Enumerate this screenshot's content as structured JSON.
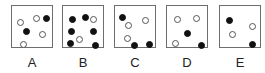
{
  "options": [
    {
      "label": "A",
      "left": 11,
      "dots": [
        {
          "x": 5,
          "y": 13,
          "type": "open"
        },
        {
          "x": 21,
          "y": 9,
          "type": "open"
        },
        {
          "x": 31,
          "y": 9,
          "type": "filled"
        },
        {
          "x": 11,
          "y": 22,
          "type": "filled"
        },
        {
          "x": 27,
          "y": 25,
          "type": "open"
        },
        {
          "x": 8,
          "y": 35,
          "type": "open"
        }
      ]
    },
    {
      "label": "B",
      "left": 62,
      "dots": [
        {
          "x": 6,
          "y": 10,
          "type": "filled"
        },
        {
          "x": 19,
          "y": 8,
          "type": "filled"
        },
        {
          "x": 27,
          "y": 10,
          "type": "open"
        },
        {
          "x": 5,
          "y": 22,
          "type": "filled"
        },
        {
          "x": 27,
          "y": 22,
          "type": "filled"
        },
        {
          "x": 13,
          "y": 30,
          "type": "open"
        },
        {
          "x": 4,
          "y": 34,
          "type": "filled"
        },
        {
          "x": 29,
          "y": 36,
          "type": "filled"
        }
      ]
    },
    {
      "label": "C",
      "left": 114,
      "dots": [
        {
          "x": 4,
          "y": 8,
          "type": "filled"
        },
        {
          "x": 10,
          "y": 16,
          "type": "open"
        },
        {
          "x": 27,
          "y": 11,
          "type": "open"
        },
        {
          "x": 9,
          "y": 29,
          "type": "open"
        },
        {
          "x": 16,
          "y": 36,
          "type": "filled"
        },
        {
          "x": 31,
          "y": 35,
          "type": "filled"
        }
      ]
    },
    {
      "label": "D",
      "left": 166,
      "dots": [
        {
          "x": 7,
          "y": 10,
          "type": "open"
        },
        {
          "x": 26,
          "y": 9,
          "type": "open"
        },
        {
          "x": 17,
          "y": 24,
          "type": "filled"
        },
        {
          "x": 5,
          "y": 34,
          "type": "open"
        },
        {
          "x": 31,
          "y": 36,
          "type": "filled"
        }
      ]
    },
    {
      "label": "E",
      "left": 219,
      "dots": [
        {
          "x": 6,
          "y": 11,
          "type": "filled"
        },
        {
          "x": 29,
          "y": 17,
          "type": "open"
        },
        {
          "x": 9,
          "y": 25,
          "type": "open"
        },
        {
          "x": 29,
          "y": 35,
          "type": "filled"
        }
      ]
    }
  ]
}
